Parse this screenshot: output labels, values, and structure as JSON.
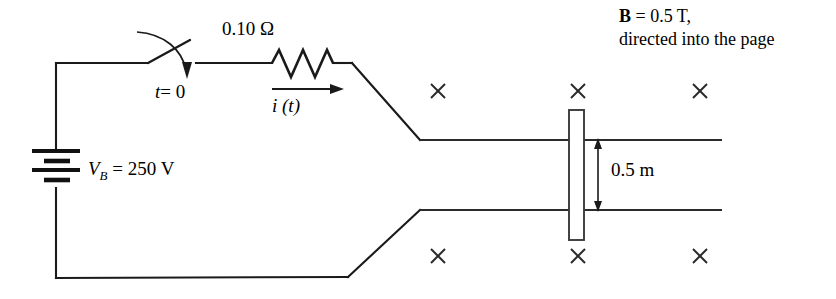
{
  "figure": {
    "width": 836,
    "height": 299,
    "background_color": "#ffffff",
    "ink_color": "#1a1a1a"
  },
  "labels": {
    "resistance": "0.10 Ω",
    "switch_time": "t = 0",
    "switch_time_symbol": "t",
    "switch_time_value": "= 0",
    "battery_symbol": "V",
    "battery_subscript": "B",
    "battery_value": "= 250 V",
    "battery_full": "V_B = 250 V",
    "current": "i (t)",
    "length": "0.5 m",
    "bfield_symbol": "B",
    "bfield_line1": "= 0.5 T,",
    "bfield_line2": "directed into the page",
    "bfield_full": "B = 0.5 T, directed into the page"
  },
  "components": {
    "battery": {
      "name": "battery",
      "voltage": "250 V",
      "plates": 4
    },
    "resistor": {
      "name": "resistor",
      "resistance": "0.10 Ω",
      "zigzag_peaks": 3
    },
    "switch": {
      "name": "switch",
      "state": "open",
      "closes_at": "t = 0"
    },
    "sliding_bar": {
      "name": "sliding-bar",
      "length": "0.5 m"
    },
    "current_arrow": {
      "name": "current-arrow",
      "direction": "right",
      "label": "i (t)"
    },
    "magnetic_field": {
      "name": "magnetic-field",
      "magnitude": "0.5 T",
      "direction": "into the page",
      "marker_glyph": "×",
      "marker_count": 6
    }
  },
  "field_markers": {
    "top_row_y": 91,
    "bottom_row_y": 256,
    "x_positions": [
      438,
      578,
      700
    ]
  }
}
